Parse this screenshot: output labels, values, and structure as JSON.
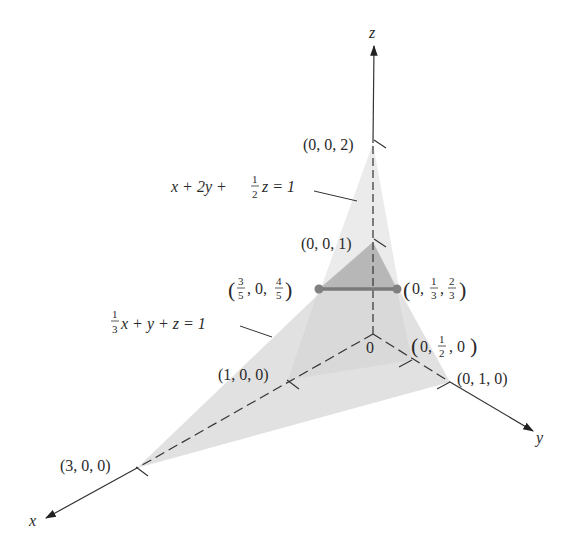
{
  "figure": {
    "colors": {
      "background": "#ffffff",
      "axis": "#333333",
      "plane_light": "#d9d9d9",
      "plane_dark": "#9e9e9e",
      "intersection_line": "#7a7a7a",
      "intersection_point": "#808080",
      "text": "#2a2a2a"
    },
    "axes": {
      "x_label": "x",
      "y_label": "y",
      "z_label": "z",
      "origin_label": "0"
    },
    "planes": [
      {
        "id": "plane-a",
        "equation": "x + 2y + ½z = 1",
        "intercepts": {
          "x": "(1, 0, 0)",
          "y": "(0, ½, 0)",
          "z": "(0, 0, 2)"
        }
      },
      {
        "id": "plane-b",
        "equation": "⅓x + y + z = 1",
        "intercepts": {
          "x": "(3, 0, 0)",
          "y": "(0, 1, 0)",
          "z": "(0, 0, 1)"
        }
      }
    ],
    "point_labels": {
      "p_002": "(0, 0, 2)",
      "p_001": "(0, 0, 1)",
      "p_100": "(1, 0, 0)",
      "p_300": "(3, 0, 0)",
      "p_0half0": "(0, 1/2, 0)",
      "p_010": "(0, 1, 0)",
      "p_left": "(3/5, 0, 4/5)",
      "p_right": "(0, 1/3, 2/3)"
    },
    "equation_labels": {
      "plane_a_lhs_1": "x + 2y + ",
      "plane_a_frac_num": "1",
      "plane_a_frac_den": "2",
      "plane_a_rhs": "z = 1",
      "plane_b_frac_num": "1",
      "plane_b_frac_den": "3",
      "plane_b_rhs": "x + y + z = 1"
    },
    "intersection_segment": {
      "from": "(3/5, 0, 4/5)",
      "to": "(0, 1/3, 2/3)"
    }
  }
}
